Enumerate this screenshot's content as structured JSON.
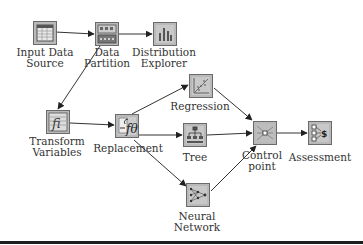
{
  "diagram": {
    "type": "SAS Enterprise Miner process flow",
    "nodes": [
      {
        "id": "input",
        "label_lines": [
          "Input Data",
          "Source"
        ],
        "icon": "data-table-icon"
      },
      {
        "id": "partition",
        "label_lines": [
          "Data",
          "Partition"
        ],
        "icon": "data-partition-icon"
      },
      {
        "id": "distribution",
        "label_lines": [
          "Distribution",
          "Explorer"
        ],
        "icon": "bar-chart-icon"
      },
      {
        "id": "transform",
        "label_lines": [
          "Transform",
          "Variables"
        ],
        "icon": "transform-icon"
      },
      {
        "id": "replacement",
        "label_lines": [
          "Replacement"
        ],
        "icon": "replacement-function-icon"
      },
      {
        "id": "regression",
        "label_lines": [
          "Regression"
        ],
        "icon": "scatter-regression-icon"
      },
      {
        "id": "tree",
        "label_lines": [
          "Tree"
        ],
        "icon": "decision-tree-icon"
      },
      {
        "id": "control",
        "label_lines": [
          "Control",
          "point"
        ],
        "icon": "control-point-icon"
      },
      {
        "id": "assessment",
        "label_lines": [
          "Assessment"
        ],
        "icon": "assessment-dollar-icon"
      },
      {
        "id": "neural",
        "label_lines": [
          "Neural",
          "Network"
        ],
        "icon": "neural-network-icon"
      }
    ],
    "edges": [
      {
        "from": "input",
        "to": "partition"
      },
      {
        "from": "partition",
        "to": "distribution"
      },
      {
        "from": "partition",
        "to": "transform"
      },
      {
        "from": "transform",
        "to": "replacement"
      },
      {
        "from": "replacement",
        "to": "regression"
      },
      {
        "from": "replacement",
        "to": "tree"
      },
      {
        "from": "replacement",
        "to": "neural"
      },
      {
        "from": "regression",
        "to": "control"
      },
      {
        "from": "tree",
        "to": "control"
      },
      {
        "from": "neural",
        "to": "control"
      },
      {
        "from": "control",
        "to": "assessment"
      }
    ]
  },
  "labels": {
    "input_1": "Input Data",
    "input_2": "Source",
    "partition_1": "Data",
    "partition_2": "Partition",
    "distribution_1": "Distribution",
    "distribution_2": "Explorer",
    "transform_1": "Transform",
    "transform_2": "Variables",
    "replacement": "Replacement",
    "regression": "Regression",
    "tree": "Tree",
    "control_1": "Control",
    "control_2": "point",
    "assessment": "Assessment",
    "neural_1": "Neural",
    "neural_2": "Network"
  },
  "colors": {
    "node_fill": "#b9b9b9",
    "node_border": "#6a6a6a",
    "edge": "#333333",
    "text": "#333333",
    "bottom_rule": "#1e1e1e"
  }
}
